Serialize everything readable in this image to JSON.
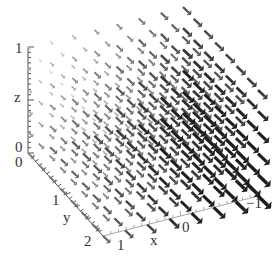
{
  "chart_data": {
    "type": "vector-field-3d",
    "title": "",
    "axes": {
      "x": {
        "label": "x",
        "range": [
          -1,
          1
        ],
        "ticks": [
          "1",
          "0",
          "-1"
        ]
      },
      "y": {
        "label": "y",
        "range": [
          0,
          2
        ],
        "ticks": [
          "0",
          "1",
          "2"
        ]
      },
      "z": {
        "label": "z",
        "range": [
          0,
          1
        ],
        "ticks": [
          "0",
          "1"
        ]
      }
    },
    "grid": {
      "nx": 8,
      "ny": 8,
      "nz": 6
    },
    "arrow_direction_screen": "down-right (toward -x, +y, -z)",
    "magnitude_trend": "larger at x=-1 and at low z; near zero at x=1, high z",
    "color": "#222222"
  },
  "labels": {
    "z_tick_top": "1",
    "z_tick_bottom": "0",
    "z_title": "z",
    "y_tick_0": "0",
    "y_tick_1": "1",
    "y_title": "y",
    "y_tick_2": "2",
    "x_tick_1": "1",
    "x_title": "x",
    "x_tick_0": "0",
    "x_tick_m1": "−1"
  }
}
